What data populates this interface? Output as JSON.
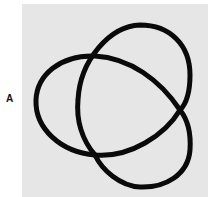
{
  "figure": {
    "panel_label": "A",
    "colors": {
      "background": "#e6e6e6",
      "stroke": "#0a0a0a"
    }
  }
}
